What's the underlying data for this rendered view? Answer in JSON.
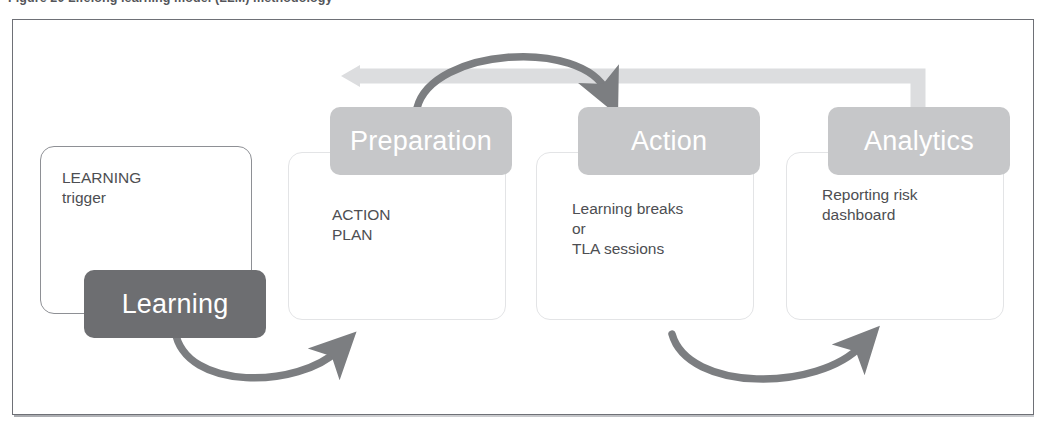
{
  "figure": {
    "caption": "Figure 20  Lifelong learning model (LLM) methodology",
    "frame_border_color": "#6e7076"
  },
  "colors": {
    "pill_light": "#c6c7c9",
    "pill_dark": "#6d6e71",
    "arrow_dark": "#7c7e81",
    "arrow_light": "#dcdddf",
    "card_border_light": "#e3e4e6",
    "card_border_dark": "#8e9095",
    "body_text": "#4d4e52",
    "pill_text": "#ffffff"
  },
  "stages": [
    {
      "id": "trigger",
      "header": null,
      "body": "LEARNING\ntrigger"
    },
    {
      "id": "preparation",
      "header": "Preparation",
      "body": "ACTION\nPLAN"
    },
    {
      "id": "action",
      "header": "Action",
      "body": "Learning breaks\nor\nTLA sessions"
    },
    {
      "id": "analytics",
      "header": "Analytics",
      "body": "Reporting risk\ndashboard"
    }
  ],
  "learning_badge": {
    "label": "Learning"
  },
  "connectors": [
    {
      "id": "feedback-band",
      "from": "analytics",
      "to": "preparation",
      "style": "light-elbow-arrow",
      "direction": "left"
    },
    {
      "id": "prep-to-action",
      "from": "preparation",
      "to": "action",
      "style": "dark-arc",
      "direction": "right"
    },
    {
      "id": "learning-to-prep",
      "from": "learning",
      "to": "preparation",
      "style": "dark-arc",
      "direction": "right"
    },
    {
      "id": "action-to-analytics",
      "from": "action",
      "to": "analytics",
      "style": "dark-arc",
      "direction": "right"
    }
  ]
}
